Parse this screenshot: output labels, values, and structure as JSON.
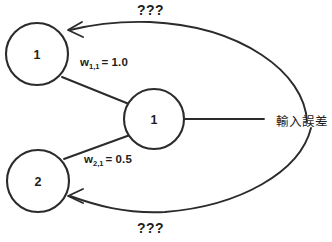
{
  "diagram": {
    "type": "neural-network-backpropagation",
    "nodes": [
      {
        "id": "output-node-1",
        "label": "1",
        "cx": 37,
        "cy": 54,
        "r": 31
      },
      {
        "id": "output-node-2",
        "label": "2",
        "cx": 38,
        "cy": 181,
        "r": 31
      },
      {
        "id": "hidden-node-1",
        "label": "1",
        "cx": 154,
        "cy": 119,
        "r": 30
      }
    ],
    "weights": [
      {
        "id": "w-1-1",
        "symbol": "w",
        "subscript": "1,1",
        "equals": "= 1.0",
        "value": 1.0
      },
      {
        "id": "w-2-1",
        "symbol": "w",
        "subscript": "2,1",
        "equals": "= 0.5",
        "value": 0.5
      }
    ],
    "annotations": {
      "top_question": "???",
      "bottom_question": "???",
      "error_source": "輸入誤差"
    },
    "colors": {
      "stroke": "#2b2b2b",
      "text": "#1d1d1d",
      "background": "#ffffff"
    }
  }
}
